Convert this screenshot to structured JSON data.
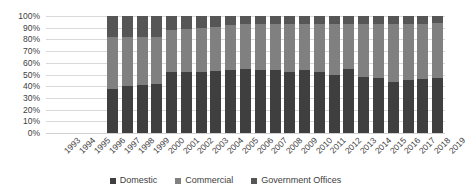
{
  "chart_data": {
    "type": "bar",
    "subtype": "stacked-100-percent",
    "title": "",
    "xlabel": "",
    "ylabel": "",
    "ylim": [
      0,
      100
    ],
    "ytick_labels": [
      "100%",
      "90%",
      "80%",
      "70%",
      "60%",
      "50%",
      "40%",
      "30%",
      "20%",
      "10%",
      "0%"
    ],
    "ytick_values": [
      100,
      90,
      80,
      70,
      60,
      50,
      40,
      30,
      20,
      10,
      0
    ],
    "grid": true,
    "legend_position": "bottom",
    "categories": [
      "1993",
      "1994",
      "1995",
      "1996",
      "1997",
      "1998",
      "1999",
      "2000",
      "2001",
      "2002",
      "2003",
      "2004",
      "2005",
      "2006",
      "2007",
      "2008",
      "2009",
      "2010",
      "2011",
      "2012",
      "2013",
      "2014",
      "2015",
      "2016",
      "2017",
      "2018",
      "2019"
    ],
    "series": [
      {
        "name": "Domestic",
        "color": "#3f3f3f",
        "values": [
          null,
          null,
          null,
          null,
          38,
          40,
          41,
          42,
          52,
          52,
          52,
          53,
          54,
          55,
          54,
          54,
          52,
          54,
          52,
          50,
          55,
          48,
          47,
          44,
          45,
          46,
          47
        ]
      },
      {
        "name": "Commercial",
        "color": "#808080",
        "values": [
          null,
          null,
          null,
          null,
          44,
          42,
          41,
          40,
          36,
          37,
          38,
          38,
          38,
          38,
          39,
          39,
          41,
          39,
          41,
          43,
          38,
          45,
          46,
          49,
          48,
          47,
          47
        ]
      },
      {
        "name": "Government Offices",
        "color": "#565656",
        "values": [
          null,
          null,
          null,
          null,
          18,
          18,
          18,
          18,
          12,
          11,
          10,
          9,
          8,
          7,
          7,
          7,
          7,
          7,
          7,
          7,
          7,
          7,
          7,
          7,
          7,
          7,
          6
        ]
      }
    ],
    "colors": {
      "domestic": "#3f3f3f",
      "commercial": "#808080",
      "government": "#565656",
      "gridline": "#d9d9d9",
      "text": "#404040",
      "background": "#ffffff"
    }
  },
  "legend": {
    "items": [
      {
        "label": "Domestic",
        "color": "#3f3f3f",
        "icon": "square-swatch-icon"
      },
      {
        "label": "Commercial",
        "color": "#808080",
        "icon": "square-swatch-icon"
      },
      {
        "label": "Government Offices",
        "color": "#565656",
        "icon": "square-swatch-icon"
      }
    ]
  }
}
